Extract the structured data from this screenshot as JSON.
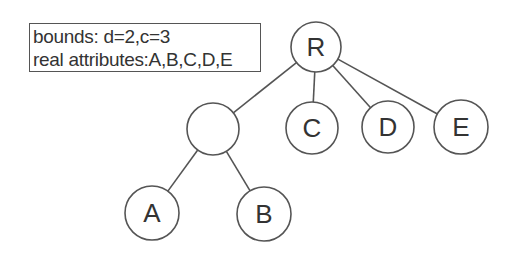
{
  "info_box": {
    "line1": "bounds: d=2,c=3",
    "line2": "real attributes:A,B,C,D,E"
  },
  "tree": {
    "nodes": [
      {
        "id": "R",
        "label": "R",
        "cx": 316,
        "cy": 47,
        "r": 25
      },
      {
        "id": "N",
        "label": "",
        "cx": 213,
        "cy": 129,
        "r": 26
      },
      {
        "id": "C",
        "label": "C",
        "cx": 312,
        "cy": 128,
        "r": 26
      },
      {
        "id": "D",
        "label": "D",
        "cx": 388,
        "cy": 127,
        "r": 26
      },
      {
        "id": "E",
        "label": "E",
        "cx": 461,
        "cy": 127,
        "r": 27
      },
      {
        "id": "A",
        "label": "A",
        "cx": 152,
        "cy": 213,
        "r": 27
      },
      {
        "id": "B",
        "label": "B",
        "cx": 264,
        "cy": 214,
        "r": 27
      }
    ],
    "edges": [
      [
        "R",
        "N"
      ],
      [
        "R",
        "C"
      ],
      [
        "R",
        "D"
      ],
      [
        "R",
        "E"
      ],
      [
        "N",
        "A"
      ],
      [
        "N",
        "B"
      ]
    ]
  },
  "colors": {
    "stroke": "#555555",
    "text": "#333333"
  }
}
